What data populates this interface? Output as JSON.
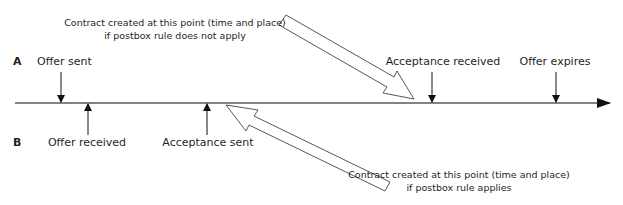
{
  "diagram": {
    "rows": {
      "a": "A",
      "b": "B"
    },
    "events_above": [
      {
        "label": "Offer sent",
        "x": 61
      },
      {
        "label": "Acceptance received",
        "x": 432
      },
      {
        "label": "Offer expires",
        "x": 556
      }
    ],
    "events_below": [
      {
        "label": "Offer received",
        "x": 88
      },
      {
        "label": "Acceptance sent",
        "x": 207
      }
    ],
    "notes": {
      "top_line1": "Contract created at this point (time and place)",
      "top_line2": "if postbox rule does not apply",
      "bottom_line1": "Contract created at this point (time and place)",
      "bottom_line2": "if postbox rule applies"
    },
    "colors": {
      "line": "#5a5a5a",
      "arrow": "#111111",
      "text": "#1f1f1f"
    }
  }
}
